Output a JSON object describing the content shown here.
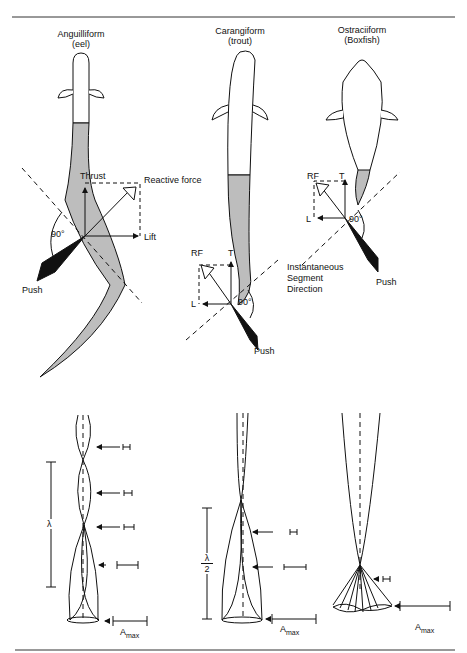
{
  "panels": [
    {
      "title": "Anguilliform",
      "subtitle": "(eel)"
    },
    {
      "title": "Carangiform",
      "subtitle": "(trout)"
    },
    {
      "title": "Ostraciiform",
      "subtitle": "(Boxfish)"
    }
  ],
  "eel_forces": {
    "thrust": "Thrust",
    "reactive": "Reactive force",
    "lift": "Lift",
    "push": "Push",
    "angle": "90°"
  },
  "trout_forces": {
    "rf": "RF",
    "t": "T",
    "l": "L",
    "push": "Push",
    "angle": "90°"
  },
  "boxfish_forces": {
    "rf": "RF",
    "t": "T",
    "l": "L",
    "push": "Push",
    "angle": "90°"
  },
  "segment_label": [
    "Instantaneous",
    "Segment",
    "Direction"
  ],
  "wave": {
    "lambda": "λ",
    "half_lambda_num": "λ",
    "half_lambda_den": "2",
    "amax": "A",
    "amax_sub": "max"
  },
  "colors": {
    "line": "#111111",
    "fill": "#bdbdbd",
    "background": "#ffffff"
  }
}
